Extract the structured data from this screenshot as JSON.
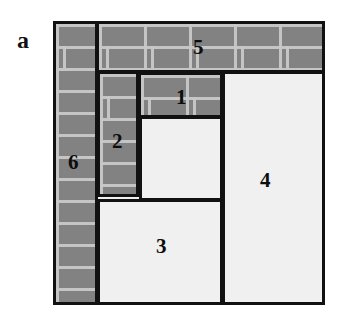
{
  "figure": {
    "panel_letter": "a",
    "caption_letter_position": {
      "x": 17,
      "y": 28
    },
    "background_color": "#ffffff",
    "outline_color": "#111111",
    "brick_fill_color": "#828282",
    "mortar_color": "#c8c8c8",
    "plain_fill_color": "#f0f0f0",
    "container": {
      "x": 53,
      "y": 21,
      "width": 272,
      "height": 284
    }
  },
  "pieces": [
    {
      "label": "5",
      "fill": "brick",
      "x": 96,
      "y": 21,
      "width": 229,
      "height": 52,
      "label_x": 193,
      "label_y": 37
    },
    {
      "label": "6",
      "fill": "brick",
      "x": 53,
      "y": 21,
      "width": 45,
      "height": 284,
      "label_x": 68,
      "label_y": 152
    },
    {
      "label": "1",
      "fill": "brick",
      "x": 138,
      "y": 72,
      "width": 85,
      "height": 46,
      "label_x": 176,
      "label_y": 87
    },
    {
      "label": "2",
      "fill": "brick",
      "x": 97,
      "y": 71,
      "width": 42,
      "height": 126,
      "label_x": 112,
      "label_y": 131
    },
    {
      "label": "",
      "fill": "plain",
      "x": 139,
      "y": 116,
      "width": 84,
      "height": 85,
      "label_x": 0,
      "label_y": 0
    },
    {
      "label": "3",
      "fill": "plain",
      "x": 97,
      "y": 199,
      "width": 126,
      "height": 106,
      "label_x": 156,
      "label_y": 236
    },
    {
      "label": "4",
      "fill": "plain",
      "x": 222,
      "y": 71,
      "width": 103,
      "height": 234,
      "label_x": 260,
      "label_y": 170
    }
  ]
}
